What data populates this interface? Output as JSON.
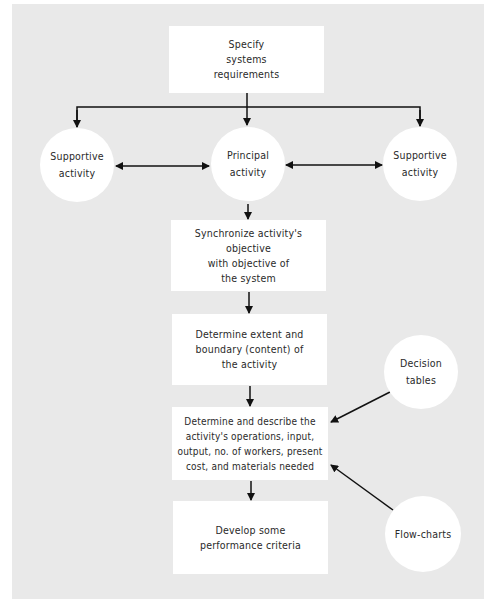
{
  "diagram": {
    "type": "flowchart",
    "colors": {
      "background": "#e9e9e9",
      "node_fill": "#ffffff",
      "line": "#111111",
      "text": "#2a2a2a"
    },
    "nodes": {
      "specify": {
        "label": "Specify\nsystems\nrequirements",
        "shape": "rectangle"
      },
      "supportive_left": {
        "label": "Supportive\nactivity",
        "shape": "circle"
      },
      "principal": {
        "label": "Principal\nactivity",
        "shape": "circle"
      },
      "supportive_right": {
        "label": "Supportive\nactivity",
        "shape": "circle"
      },
      "synchronize": {
        "label": "Synchronize activity's objective\nwith objective of\nthe system",
        "shape": "rectangle"
      },
      "extent": {
        "label": "Determine extent and\nboundary (content) of\nthe activity",
        "shape": "rectangle"
      },
      "describe": {
        "label": "Determine and describe the\nactivity's operations, input,\noutput, no. of workers, present\ncost, and materials needed",
        "shape": "rectangle"
      },
      "criteria": {
        "label": "Develop some\nperformance criteria",
        "shape": "rectangle"
      },
      "decision_tables": {
        "label": "Decision\ntables",
        "shape": "circle"
      },
      "flow_charts": {
        "label": "Flow-charts",
        "shape": "circle"
      }
    },
    "edges": [
      {
        "from": "specify",
        "to": "supportive_left"
      },
      {
        "from": "specify",
        "to": "principal"
      },
      {
        "from": "specify",
        "to": "supportive_right"
      },
      {
        "from": "principal",
        "to": "supportive_left",
        "bidirectional": true
      },
      {
        "from": "principal",
        "to": "supportive_right",
        "bidirectional": true
      },
      {
        "from": "principal",
        "to": "synchronize"
      },
      {
        "from": "synchronize",
        "to": "extent"
      },
      {
        "from": "extent",
        "to": "describe"
      },
      {
        "from": "describe",
        "to": "criteria"
      },
      {
        "from": "decision_tables",
        "to": "describe"
      },
      {
        "from": "flow_charts",
        "to": "describe"
      }
    ]
  }
}
